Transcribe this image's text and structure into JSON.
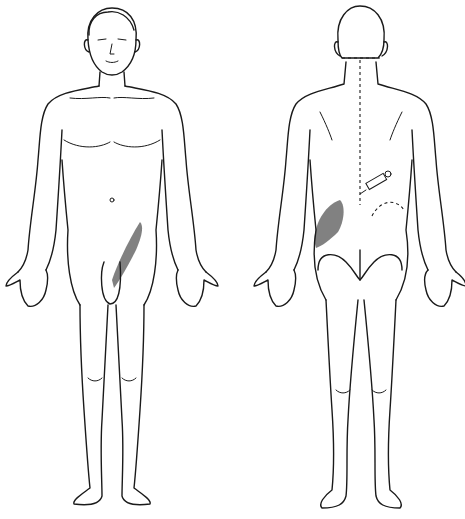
{
  "figure": {
    "type": "anatomical body diagram",
    "views": [
      {
        "id": "anterior",
        "label": "Front view (male)"
      },
      {
        "id": "posterior",
        "label": "Back view (male)"
      }
    ],
    "annotations": {
      "anterior_stipple": {
        "region": "right groin / inguinal area",
        "style": "stippled pain pattern"
      },
      "posterior_stipple": {
        "region": "left upper buttock / iliac area",
        "style": "stippled pain pattern"
      },
      "spine_markers": {
        "region": "vertebral column",
        "style": "dotted vertebrae",
        "count": 20
      },
      "needle": {
        "region": "lower lumbar, right of spine",
        "style": "syringe icon"
      },
      "trigger_dashed_arc": {
        "region": "right lumbar",
        "style": "dashed arc"
      }
    },
    "colors": {
      "line": "#1a1a1a",
      "background": "#ffffff"
    }
  }
}
